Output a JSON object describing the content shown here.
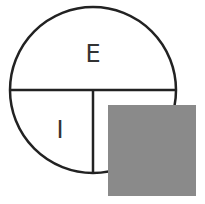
{
  "diagram": {
    "labels": {
      "top": "E",
      "bottom_left": "I"
    },
    "colors": {
      "stroke": "#222222",
      "square_fill": "#8a8a8a"
    }
  }
}
